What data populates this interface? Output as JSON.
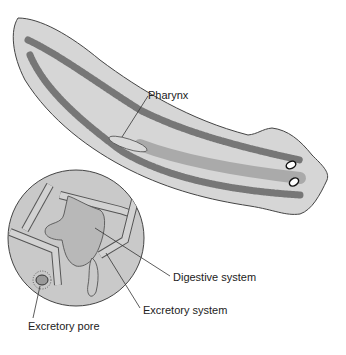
{
  "diagram": {
    "labels": {
      "pharynx": "Pharynx",
      "digestive": "Digestive system",
      "excretory_system": "Excretory system",
      "excretory_pore": "Excretory pore"
    },
    "colors": {
      "body_fill": "#d4d4d4",
      "gut_fill": "#a8a8a8",
      "outline": "#444444",
      "inset_fill": "#c8c8c8"
    }
  }
}
